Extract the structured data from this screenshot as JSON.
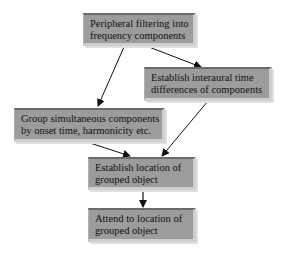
{
  "diagram": {
    "type": "flowchart",
    "nodes": [
      {
        "id": "n1",
        "lines": [
          "Peripheral filtering into",
          "frequency components"
        ]
      },
      {
        "id": "n2",
        "lines": [
          "Establish interaural time",
          "differences of components"
        ]
      },
      {
        "id": "n3",
        "lines": [
          "Group simultaneous components",
          "by onset time, harmonicity etc."
        ]
      },
      {
        "id": "n4",
        "lines": [
          "Establish location of",
          "grouped object"
        ]
      },
      {
        "id": "n5",
        "lines": [
          "Attend to location of",
          "grouped object"
        ]
      }
    ],
    "edges": [
      {
        "from": "n1",
        "to": "n3"
      },
      {
        "from": "n1",
        "to": "n2"
      },
      {
        "from": "n3",
        "to": "n4"
      },
      {
        "from": "n2",
        "to": "n4"
      },
      {
        "from": "n4",
        "to": "n5"
      }
    ],
    "colors": {
      "box_fill": "#9c9c9c",
      "box_shadow": "#cfcfcf",
      "text": "#111111",
      "arrow": "#111111",
      "background": "#ffffff"
    }
  }
}
